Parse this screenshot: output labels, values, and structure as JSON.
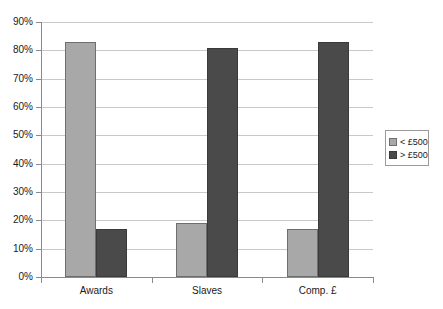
{
  "chart_data": {
    "type": "bar",
    "title": "",
    "subtitle": "",
    "xlabel": "",
    "ylabel": "",
    "categories": [
      "Awards",
      "Slaves",
      "Comp. £"
    ],
    "series": [
      {
        "name": "< £500",
        "color": "#a8a8a8",
        "values": [
          83,
          19,
          17
        ]
      },
      {
        "name": "> £500",
        "color": "#4a4a4a",
        "values": [
          17,
          81,
          83
        ]
      }
    ],
    "ylim": [
      0,
      90
    ],
    "ytick_step": 10,
    "ytick_labels": [
      "90%",
      "80%",
      "70%",
      "60%",
      "50%",
      "40%",
      "30%",
      "20%",
      "10%",
      "0%"
    ],
    "ytick_values": [
      90,
      80,
      70,
      60,
      50,
      40,
      30,
      20,
      10,
      0
    ],
    "grid": "horizontal",
    "legend_position": "right",
    "value_unit": "percent",
    "background_color": "#ffffff",
    "gridline_color": "#c9c9c9",
    "axis_color": "#8a8a8a"
  }
}
